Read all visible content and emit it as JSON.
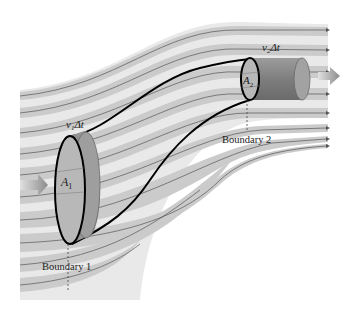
{
  "figure": {
    "type": "fluid-flow-continuity-diagram",
    "labels": {
      "v1dt_main": "v",
      "v1dt_sub": "1",
      "v1dt_tail": "Δt",
      "v2dt_main": "v",
      "v2dt_sub": "2",
      "v2dt_tail": "Δt",
      "a1_main": "A",
      "a1_sub": "1",
      "a2_main": "A",
      "a2_sub": "2",
      "boundary1": "Boundary 1",
      "boundary2": "Boundary 2"
    },
    "colors": {
      "stream_band": "#cfcfcf",
      "stream_band_light": "#e6e6e6",
      "streamline": "#555555",
      "tube_outline": "#000000",
      "cylinder_body": "#8a8a8a",
      "cylinder_face": "#b4b4b4",
      "flow_arrow": "#9a9a9a",
      "text": "#222222"
    },
    "flow_arrows": [
      "inflow-arrow-left",
      "outflow-arrow-right"
    ]
  }
}
